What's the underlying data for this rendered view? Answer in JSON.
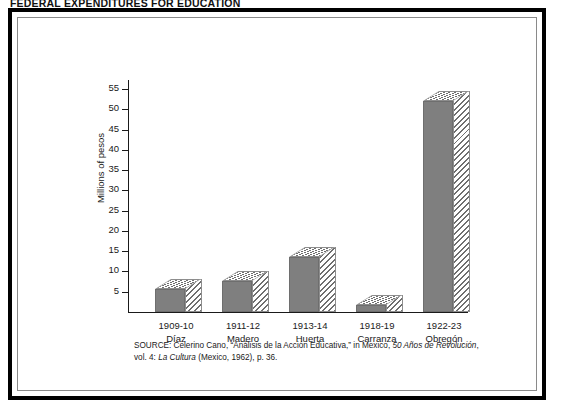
{
  "page_title": "FEDERAL EXPENDITURES FOR EDUCATION",
  "source_note": {
    "prefix": "SOURCE: Celerino Cano, “Análisis de la Acción Educativa,” in Mexico, ",
    "italic_1": "50 Años de Revolución",
    "middle": ", vol. 4: ",
    "italic_2": "La Cultura",
    "suffix": " (Mexico, 1962), p. 36."
  },
  "colors": {
    "bar_front": "#7f7f7f",
    "bar_hatch": "#6f6f6f",
    "axis": "#1a1a1a",
    "frame_outer": "#000000",
    "frame_inner": "#8a8a8a"
  },
  "chart_data": {
    "type": "bar",
    "title": "FEDERAL EXPENDITURES FOR EDUCATION",
    "xlabel": "",
    "ylabel": "Millions of pesos",
    "ylim": [
      0,
      57.5
    ],
    "yticks": [
      5,
      10,
      15,
      20,
      25,
      30,
      35,
      40,
      45,
      50,
      55
    ],
    "ytick_labels": [
      "5",
      "10",
      "15",
      "20",
      "25",
      "30",
      "35",
      "40",
      "45",
      "50",
      "55"
    ],
    "grid": false,
    "legend": null,
    "categories": [
      "1909-10",
      "1911-12",
      "1913-14",
      "1918-19",
      "1922-23"
    ],
    "category_sublabels": [
      "Díaz",
      "Madero",
      "Huerta",
      "Carranza",
      "Obregón"
    ],
    "values": [
      5.6,
      7.7,
      13.5,
      1.8,
      52.0
    ],
    "series": [
      {
        "name": "Federal expenditures for education",
        "values": [
          5.6,
          7.7,
          13.5,
          1.8,
          52.0
        ]
      }
    ],
    "units": "millions of pesos"
  }
}
